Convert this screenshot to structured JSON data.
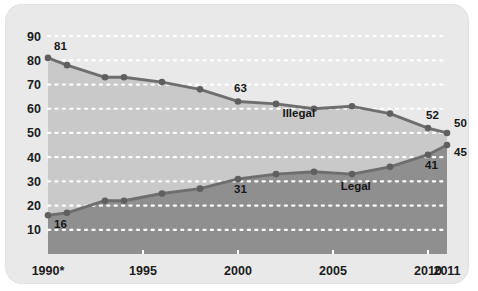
{
  "chart_data": {
    "type": "area",
    "title": "",
    "subtitle": "",
    "xlabel": "",
    "ylabel": "",
    "xlim": [
      1990,
      2011
    ],
    "ylim": [
      0,
      95
    ],
    "yticks": [
      10,
      20,
      30,
      40,
      50,
      60,
      70,
      80,
      90
    ],
    "xticks": [
      1990,
      1995,
      2000,
      2005,
      2010,
      2011
    ],
    "xtick_labels": [
      "1990*",
      "1995",
      "2000",
      "2005",
      "2010",
      "2011"
    ],
    "grid": "horizontal-dotted-white",
    "legend": "inline-labels",
    "x": [
      1990,
      1991,
      1993,
      1994,
      1996,
      1998,
      2000,
      2002,
      2004,
      2006,
      2008,
      2010,
      2011
    ],
    "series": [
      {
        "name": "Illegal",
        "color": "#6e6e6e",
        "fill": "#c9c9c9",
        "values": [
          81,
          78,
          73,
          73,
          71,
          68,
          63,
          62,
          60,
          61,
          58,
          52,
          50
        ]
      },
      {
        "name": "Legal",
        "color": "#6e6e6e",
        "fill": "#8f8f8f",
        "values": [
          16,
          17,
          22,
          22,
          25,
          27,
          31,
          33,
          34,
          33,
          36,
          41,
          45
        ]
      }
    ],
    "point_labels": [
      {
        "series": "Illegal",
        "x": 1990,
        "value": 81,
        "text": "81",
        "dx": 6,
        "dy": -8
      },
      {
        "series": "Illegal",
        "x": 2000,
        "value": 63,
        "text": "63",
        "dx": -4,
        "dy": -9
      },
      {
        "series": "Illegal",
        "x": 2010,
        "value": 52,
        "text": "52",
        "dx": -2,
        "dy": -9
      },
      {
        "series": "Illegal",
        "x": 2011,
        "value": 50,
        "text": "50",
        "dx": 7,
        "dy": -6
      },
      {
        "series": "Legal",
        "x": 1990,
        "value": 16,
        "text": "16",
        "dx": 6,
        "dy": 13
      },
      {
        "series": "Legal",
        "x": 2000,
        "value": 31,
        "text": "31",
        "dx": -4,
        "dy": 14
      },
      {
        "series": "Legal",
        "x": 2010,
        "value": 41,
        "text": "41",
        "dx": -3,
        "dy": 14
      },
      {
        "series": "Legal",
        "x": 2011,
        "value": 45,
        "text": "45",
        "dx": 7,
        "dy": 11
      }
    ],
    "series_annotations": [
      {
        "text": "Illegal",
        "x": 2003.2,
        "y": 56.5
      },
      {
        "text": "Legal",
        "x": 2006.2,
        "y": 26.5
      }
    ],
    "colors": {
      "card_background": "#e9e9e9",
      "upper_band": "#c9c9c9",
      "lower_band": "#8f8f8f",
      "line": "#6e6e6e",
      "marker": "#5f5f5f",
      "gridline": "#ffffff",
      "text": "#1b1b1b"
    }
  }
}
